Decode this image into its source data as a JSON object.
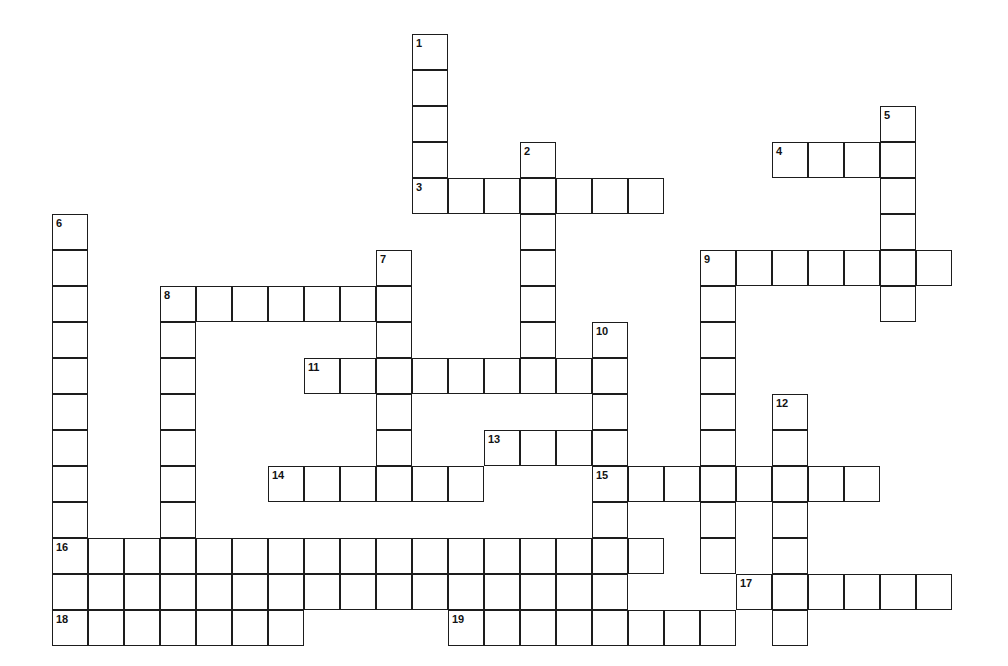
{
  "puzzle": {
    "kind": "crossword-grid",
    "title": "Crossword Puzzle Grid",
    "background_color": "#ffffff",
    "cell_line_color": "#1d1d1d",
    "number_color": "#131313",
    "cell_size_px": 36,
    "origin_x_px": 52,
    "origin_y_px": 34,
    "columns": 26,
    "rows": 17,
    "entry_count": 19,
    "across_count": 11,
    "down_count": 8
  },
  "entries": [
    {
      "number": "1",
      "direction": "down",
      "col": 10,
      "row": 0,
      "length": 5
    },
    {
      "number": "2",
      "direction": "down",
      "col": 13,
      "row": 3,
      "length": 7
    },
    {
      "number": "3",
      "direction": "across",
      "col": 10,
      "row": 4,
      "length": 7
    },
    {
      "number": "4",
      "direction": "across",
      "col": 20,
      "row": 3,
      "length": 4
    },
    {
      "number": "5",
      "direction": "down",
      "col": 23,
      "row": 2,
      "length": 6
    },
    {
      "number": "6",
      "direction": "down",
      "col": 0,
      "row": 5,
      "length": 12
    },
    {
      "number": "7",
      "direction": "down",
      "col": 9,
      "row": 6,
      "length": 7
    },
    {
      "number": "8",
      "direction": "across",
      "col": 3,
      "row": 7,
      "length": 7
    },
    {
      "number": "8",
      "direction": "down",
      "col": 3,
      "row": 7,
      "length": 10
    },
    {
      "number": "9",
      "direction": "across",
      "col": 18,
      "row": 6,
      "length": 7
    },
    {
      "number": "9",
      "direction": "down",
      "col": 18,
      "row": 6,
      "length": 8
    },
    {
      "number": "10",
      "direction": "down",
      "col": 15,
      "row": 8,
      "length": 9
    },
    {
      "number": "11",
      "direction": "across",
      "col": 7,
      "row": 9,
      "length": 9
    },
    {
      "number": "12",
      "direction": "down",
      "col": 20,
      "row": 10,
      "length": 7
    },
    {
      "number": "13",
      "direction": "across",
      "col": 12,
      "row": 11,
      "length": 4
    },
    {
      "number": "14",
      "direction": "across",
      "col": 6,
      "row": 12,
      "length": 6
    },
    {
      "number": "15",
      "direction": "across",
      "col": 15,
      "row": 12,
      "length": 8
    },
    {
      "number": "16",
      "direction": "across",
      "col": 0,
      "row": 14,
      "length": 17
    },
    {
      "number": "17",
      "direction": "across",
      "col": 19,
      "row": 15,
      "length": 6
    },
    {
      "number": "18",
      "direction": "across",
      "col": 0,
      "row": 16,
      "length": 7
    },
    {
      "number": "19",
      "direction": "across",
      "col": 11,
      "row": 16,
      "length": 8
    }
  ],
  "cells": [
    {
      "col": 10,
      "row": 0,
      "number": "1"
    },
    {
      "col": 10,
      "row": 1
    },
    {
      "col": 10,
      "row": 2
    },
    {
      "col": 10,
      "row": 3
    },
    {
      "col": 23,
      "row": 2,
      "number": "5"
    },
    {
      "col": 13,
      "row": 3,
      "number": "2"
    },
    {
      "col": 20,
      "row": 3,
      "number": "4"
    },
    {
      "col": 21,
      "row": 3
    },
    {
      "col": 22,
      "row": 3
    },
    {
      "col": 23,
      "row": 3
    },
    {
      "col": 10,
      "row": 4,
      "number": "3"
    },
    {
      "col": 11,
      "row": 4
    },
    {
      "col": 12,
      "row": 4
    },
    {
      "col": 13,
      "row": 4
    },
    {
      "col": 14,
      "row": 4
    },
    {
      "col": 15,
      "row": 4
    },
    {
      "col": 16,
      "row": 4
    },
    {
      "col": 23,
      "row": 4
    },
    {
      "col": 0,
      "row": 5,
      "number": "6"
    },
    {
      "col": 13,
      "row": 5
    },
    {
      "col": 23,
      "row": 5
    },
    {
      "col": 0,
      "row": 6
    },
    {
      "col": 9,
      "row": 6,
      "number": "7"
    },
    {
      "col": 13,
      "row": 6
    },
    {
      "col": 18,
      "row": 6,
      "number": "9"
    },
    {
      "col": 19,
      "row": 6
    },
    {
      "col": 20,
      "row": 6
    },
    {
      "col": 21,
      "row": 6
    },
    {
      "col": 22,
      "row": 6
    },
    {
      "col": 23,
      "row": 6
    },
    {
      "col": 24,
      "row": 6
    },
    {
      "col": 0,
      "row": 7
    },
    {
      "col": 3,
      "row": 7,
      "number": "8"
    },
    {
      "col": 4,
      "row": 7
    },
    {
      "col": 5,
      "row": 7
    },
    {
      "col": 6,
      "row": 7
    },
    {
      "col": 7,
      "row": 7
    },
    {
      "col": 8,
      "row": 7
    },
    {
      "col": 9,
      "row": 7
    },
    {
      "col": 13,
      "row": 7
    },
    {
      "col": 18,
      "row": 7
    },
    {
      "col": 23,
      "row": 7
    },
    {
      "col": 0,
      "row": 8
    },
    {
      "col": 3,
      "row": 8
    },
    {
      "col": 9,
      "row": 8
    },
    {
      "col": 13,
      "row": 8
    },
    {
      "col": 15,
      "row": 8,
      "number": "10"
    },
    {
      "col": 18,
      "row": 8
    },
    {
      "col": 0,
      "row": 9
    },
    {
      "col": 3,
      "row": 9
    },
    {
      "col": 7,
      "row": 9,
      "number": "11"
    },
    {
      "col": 8,
      "row": 9
    },
    {
      "col": 9,
      "row": 9
    },
    {
      "col": 10,
      "row": 9
    },
    {
      "col": 11,
      "row": 9
    },
    {
      "col": 12,
      "row": 9
    },
    {
      "col": 13,
      "row": 9
    },
    {
      "col": 14,
      "row": 9
    },
    {
      "col": 15,
      "row": 9
    },
    {
      "col": 18,
      "row": 9
    },
    {
      "col": 0,
      "row": 10
    },
    {
      "col": 3,
      "row": 10
    },
    {
      "col": 9,
      "row": 10
    },
    {
      "col": 15,
      "row": 10
    },
    {
      "col": 18,
      "row": 10
    },
    {
      "col": 20,
      "row": 10,
      "number": "12"
    },
    {
      "col": 0,
      "row": 11
    },
    {
      "col": 3,
      "row": 11
    },
    {
      "col": 9,
      "row": 11
    },
    {
      "col": 12,
      "row": 11,
      "number": "13"
    },
    {
      "col": 13,
      "row": 11
    },
    {
      "col": 14,
      "row": 11
    },
    {
      "col": 15,
      "row": 11
    },
    {
      "col": 18,
      "row": 11
    },
    {
      "col": 20,
      "row": 11
    },
    {
      "col": 0,
      "row": 12
    },
    {
      "col": 3,
      "row": 12
    },
    {
      "col": 6,
      "row": 12,
      "number": "14"
    },
    {
      "col": 7,
      "row": 12
    },
    {
      "col": 8,
      "row": 12
    },
    {
      "col": 9,
      "row": 12
    },
    {
      "col": 10,
      "row": 12
    },
    {
      "col": 11,
      "row": 12
    },
    {
      "col": 15,
      "row": 12,
      "number": "15"
    },
    {
      "col": 16,
      "row": 12
    },
    {
      "col": 17,
      "row": 12
    },
    {
      "col": 18,
      "row": 12
    },
    {
      "col": 19,
      "row": 12
    },
    {
      "col": 20,
      "row": 12
    },
    {
      "col": 21,
      "row": 12
    },
    {
      "col": 22,
      "row": 12
    },
    {
      "col": 0,
      "row": 13
    },
    {
      "col": 3,
      "row": 13
    },
    {
      "col": 15,
      "row": 13
    },
    {
      "col": 18,
      "row": 13
    },
    {
      "col": 20,
      "row": 13
    },
    {
      "col": 0,
      "row": 14,
      "number": "16"
    },
    {
      "col": 1,
      "row": 14
    },
    {
      "col": 2,
      "row": 14
    },
    {
      "col": 3,
      "row": 14
    },
    {
      "col": 4,
      "row": 14
    },
    {
      "col": 5,
      "row": 14
    },
    {
      "col": 6,
      "row": 14
    },
    {
      "col": 7,
      "row": 14
    },
    {
      "col": 8,
      "row": 14
    },
    {
      "col": 9,
      "row": 14
    },
    {
      "col": 10,
      "row": 14
    },
    {
      "col": 11,
      "row": 14
    },
    {
      "col": 12,
      "row": 14
    },
    {
      "col": 13,
      "row": 14
    },
    {
      "col": 14,
      "row": 14
    },
    {
      "col": 15,
      "row": 14
    },
    {
      "col": 16,
      "row": 14
    },
    {
      "col": 18,
      "row": 14
    },
    {
      "col": 20,
      "row": 14
    },
    {
      "col": 0,
      "row": 15
    },
    {
      "col": 1,
      "row": 15
    },
    {
      "col": 2,
      "row": 15
    },
    {
      "col": 3,
      "row": 15
    },
    {
      "col": 4,
      "row": 15
    },
    {
      "col": 5,
      "row": 15
    },
    {
      "col": 6,
      "row": 15
    },
    {
      "col": 7,
      "row": 15
    },
    {
      "col": 8,
      "row": 15
    },
    {
      "col": 9,
      "row": 15
    },
    {
      "col": 10,
      "row": 15
    },
    {
      "col": 11,
      "row": 15
    },
    {
      "col": 12,
      "row": 15
    },
    {
      "col": 13,
      "row": 15
    },
    {
      "col": 14,
      "row": 15
    },
    {
      "col": 15,
      "row": 15
    },
    {
      "col": 19,
      "row": 15,
      "number": "17"
    },
    {
      "col": 20,
      "row": 15
    },
    {
      "col": 21,
      "row": 15
    },
    {
      "col": 22,
      "row": 15
    },
    {
      "col": 23,
      "row": 15
    },
    {
      "col": 24,
      "row": 15
    },
    {
      "col": 0,
      "row": 16,
      "number": "18"
    },
    {
      "col": 1,
      "row": 16
    },
    {
      "col": 2,
      "row": 16
    },
    {
      "col": 3,
      "row": 16
    },
    {
      "col": 4,
      "row": 16
    },
    {
      "col": 5,
      "row": 16
    },
    {
      "col": 6,
      "row": 16
    },
    {
      "col": 11,
      "row": 16,
      "number": "19"
    },
    {
      "col": 12,
      "row": 16
    },
    {
      "col": 13,
      "row": 16
    },
    {
      "col": 14,
      "row": 16
    },
    {
      "col": 15,
      "row": 16
    },
    {
      "col": 16,
      "row": 16
    },
    {
      "col": 17,
      "row": 16
    },
    {
      "col": 18,
      "row": 16
    },
    {
      "col": 20,
      "row": 16
    }
  ]
}
